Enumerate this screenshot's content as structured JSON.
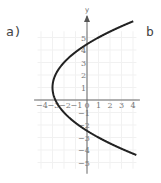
{
  "labels": {
    "left": "a)",
    "right": "b"
  },
  "chart_data": {
    "type": "line",
    "title": "",
    "xlabel": "",
    "ylabel": "y",
    "xlim": [
      -4.5,
      4.5
    ],
    "ylim": [
      -5.8,
      6
    ],
    "xticks": [
      -4,
      -3,
      -2,
      -1,
      0,
      1,
      2,
      3,
      4
    ],
    "yticks": [
      -5,
      -4,
      -3,
      -2,
      -1,
      1,
      2,
      3,
      4,
      5
    ],
    "grid": true,
    "equation": "x = (y-1)^2/4 - 3",
    "series": [
      {
        "name": "parabola",
        "vertex": [
          -3,
          1
        ],
        "points": [
          [
            4.3,
            6.3
          ],
          [
            1,
            5
          ],
          [
            0,
            4.46
          ],
          [
            -2,
            3
          ],
          [
            -3,
            1
          ],
          [
            -2,
            -1
          ],
          [
            0,
            -2.46
          ],
          [
            1,
            -3
          ],
          [
            4.3,
            -4.3
          ]
        ]
      }
    ],
    "color": "#222222"
  }
}
